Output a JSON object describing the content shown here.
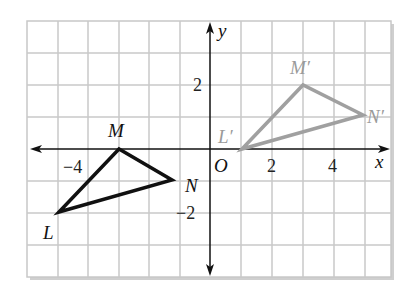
{
  "figure": {
    "type": "coordinate-plane-translation",
    "axes": {
      "x_label": "x",
      "y_label": "y",
      "origin_label": "O",
      "x_tick_labels": [
        {
          "value": -4,
          "text": "−4"
        },
        {
          "value": 2,
          "text": "2"
        },
        {
          "value": 4,
          "text": "4"
        }
      ],
      "y_tick_labels": [
        {
          "value": 2,
          "text": "2"
        },
        {
          "value": -2,
          "text": "−2"
        }
      ],
      "x_range": [
        -6,
        6
      ],
      "y_range": [
        -4,
        4
      ],
      "grid": true
    },
    "original_triangle": {
      "color": "#111111",
      "vertices": [
        {
          "name": "L",
          "label": "L",
          "x": -5,
          "y": -2
        },
        {
          "name": "M",
          "label": "M",
          "x": -3,
          "y": 0
        },
        {
          "name": "N",
          "label": "N",
          "x": -1,
          "y": -1
        }
      ]
    },
    "image_triangle": {
      "color": "#a0a0a0",
      "vertices": [
        {
          "name": "L'",
          "label": "L′",
          "x": 1,
          "y": 0
        },
        {
          "name": "M'",
          "label": "M′",
          "x": 3,
          "y": 2
        },
        {
          "name": "N'",
          "label": "N′",
          "x": 5,
          "y": 1
        }
      ]
    },
    "colors": {
      "grid": "#c8c8c8",
      "axis": "#111111",
      "frame_shadow": "#bdbdbd"
    }
  }
}
